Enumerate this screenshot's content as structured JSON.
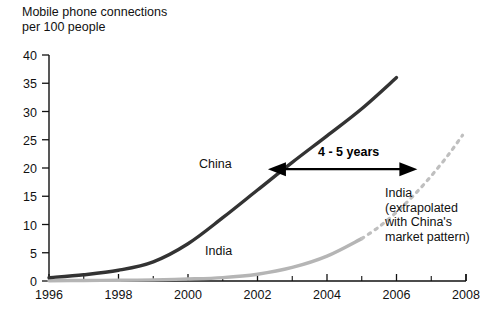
{
  "chart_data": {
    "type": "line",
    "title": "Mobile phone connections\nper 100 people",
    "xlabel": "",
    "ylabel": "",
    "xlim": [
      1996,
      2008
    ],
    "ylim": [
      0,
      40
    ],
    "xticks": [
      "1996",
      "1998",
      "2000",
      "2002",
      "2004",
      "2006",
      "2008"
    ],
    "yticks": [
      "0",
      "5",
      "10",
      "15",
      "20",
      "25",
      "30",
      "35",
      "40"
    ],
    "ytick_step": 5,
    "xtick_step": 2,
    "minor_xtick_step": 1,
    "grid": false,
    "legend": "inline-labels",
    "series": [
      {
        "name": "China",
        "style": "solid",
        "color": "#333333",
        "label": "China",
        "x": [
          1996,
          1997,
          1998,
          1999,
          2000,
          2001,
          2002,
          2003,
          2004,
          2005,
          2006
        ],
        "values": [
          0.6,
          1.1,
          1.9,
          3.4,
          6.6,
          11.2,
          16.1,
          21.0,
          25.7,
          30.5,
          36.0
        ]
      },
      {
        "name": "India",
        "style": "solid",
        "color": "#b5b5b5",
        "label": "India",
        "x": [
          1996,
          1997,
          1998,
          1999,
          2000,
          2001,
          2002,
          2003,
          2004,
          2005
        ],
        "values": [
          0.05,
          0.1,
          0.12,
          0.2,
          0.35,
          0.6,
          1.2,
          2.4,
          4.4,
          7.5
        ]
      },
      {
        "name": "India extrapolated",
        "style": "dashed",
        "color": "#bfbfbf",
        "label": "India\n(extrapolated\nwith China's\nmarket pattern)",
        "x": [
          2005,
          2005.5,
          2006,
          2006.5,
          2007,
          2007.5,
          2007.9
        ],
        "values": [
          7.5,
          9.6,
          12.2,
          15.2,
          18.6,
          22.4,
          25.8
        ]
      }
    ],
    "annotations": [
      {
        "name": "time-gap-arrow",
        "label": "4 - 5 years",
        "x_start": 2002.3,
        "x_end": 2006.6,
        "y": 19.8,
        "arrow": "double"
      }
    ]
  },
  "axis": {
    "y_axis_name": "y-axis",
    "x_axis_name": "x-axis"
  }
}
